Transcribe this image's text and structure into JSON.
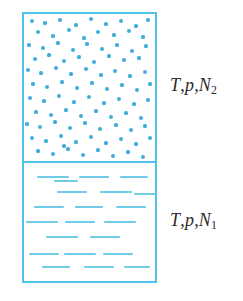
{
  "figure": {
    "background_color": "#ffffff",
    "outline_color": "#4FC3E8",
    "molecule_color": "#3FAEDC",
    "dash_color": "#6FCBE8",
    "label_color": "#2b2b2b"
  },
  "labels": {
    "gas": {
      "temperature_symbol": "T",
      "separator": ",",
      "pressure_symbol": "p",
      "amount_symbol": "N",
      "amount_subscript": "2",
      "full_text": "T, p, N2"
    },
    "liquid": {
      "temperature_symbol": "T",
      "separator": ",",
      "pressure_symbol": "p",
      "amount_symbol": "N",
      "amount_subscript": "1",
      "full_text": "T, p, N1"
    }
  },
  "regions": {
    "gas": {
      "name": "gas-phase",
      "representation": "scattered-dots",
      "molecule_count": 96
    },
    "liquid": {
      "name": "liquid-phase",
      "representation": "horizontal-dashes",
      "molecule_count": 21
    }
  },
  "chart_data": {
    "type": "scatter",
    "xlabel": "",
    "ylabel": "",
    "xlim": [
      0,
      131
    ],
    "ylim": [
      0,
      267
    ],
    "grid": false,
    "legend": "none",
    "annotations": [
      "T, p, N2",
      "T, p, N1"
    ],
    "series": [
      {
        "name": "gas-molecules",
        "marker": "dot",
        "color": "#3FAEDC",
        "points": [
          [
            8,
            7,
            2.0
          ],
          [
            21,
            9,
            1.6
          ],
          [
            36,
            6,
            2.0
          ],
          [
            52,
            11,
            1.6
          ],
          [
            67,
            5,
            2.4
          ],
          [
            82,
            10,
            1.6
          ],
          [
            97,
            7,
            2.0
          ],
          [
            112,
            12,
            1.6
          ],
          [
            124,
            6,
            2.0
          ],
          [
            14,
            18,
            2.4
          ],
          [
            29,
            22,
            1.6
          ],
          [
            45,
            16,
            2.0
          ],
          [
            60,
            24,
            1.6
          ],
          [
            74,
            18,
            2.4
          ],
          [
            90,
            21,
            1.6
          ],
          [
            105,
            17,
            2.0
          ],
          [
            119,
            23,
            1.6
          ],
          [
            5,
            31,
            1.6
          ],
          [
            19,
            34,
            2.4
          ],
          [
            34,
            29,
            1.6
          ],
          [
            49,
            36,
            2.0
          ],
          [
            63,
            30,
            1.6
          ],
          [
            78,
            35,
            2.4
          ],
          [
            93,
            31,
            1.6
          ],
          [
            108,
            37,
            2.0
          ],
          [
            122,
            32,
            1.6
          ],
          [
            11,
            45,
            2.0
          ],
          [
            25,
            41,
            1.6
          ],
          [
            40,
            47,
            2.4
          ],
          [
            55,
            43,
            1.6
          ],
          [
            70,
            48,
            2.0
          ],
          [
            85,
            42,
            1.6
          ],
          [
            100,
            46,
            2.4
          ],
          [
            115,
            44,
            1.6
          ],
          [
            4,
            56,
            2.4
          ],
          [
            17,
            59,
            1.6
          ],
          [
            32,
            54,
            2.0
          ],
          [
            47,
            60,
            1.6
          ],
          [
            62,
            55,
            2.4
          ],
          [
            77,
            61,
            1.6
          ],
          [
            91,
            57,
            2.0
          ],
          [
            106,
            62,
            1.6
          ],
          [
            121,
            58,
            2.0
          ],
          [
            9,
            70,
            1.6
          ],
          [
            23,
            73,
            2.4
          ],
          [
            38,
            68,
            1.6
          ],
          [
            53,
            74,
            2.0
          ],
          [
            68,
            69,
            1.6
          ],
          [
            83,
            75,
            2.4
          ],
          [
            98,
            71,
            1.6
          ],
          [
            113,
            76,
            2.0
          ],
          [
            126,
            70,
            1.6
          ],
          [
            6,
            84,
            2.0
          ],
          [
            20,
            87,
            1.6
          ],
          [
            35,
            82,
            2.4
          ],
          [
            50,
            88,
            1.6
          ],
          [
            65,
            83,
            2.0
          ],
          [
            80,
            89,
            1.6
          ],
          [
            95,
            85,
            2.4
          ],
          [
            110,
            90,
            1.6
          ],
          [
            124,
            86,
            2.0
          ],
          [
            12,
            98,
            1.6
          ],
          [
            27,
            101,
            2.4
          ],
          [
            42,
            96,
            1.6
          ],
          [
            57,
            102,
            2.0
          ],
          [
            72,
            97,
            1.6
          ],
          [
            87,
            103,
            2.4
          ],
          [
            102,
            99,
            1.6
          ],
          [
            117,
            104,
            2.0
          ],
          [
            3,
            110,
            1.6
          ],
          [
            16,
            113,
            2.0
          ],
          [
            31,
            108,
            1.6
          ],
          [
            46,
            114,
            2.4
          ],
          [
            61,
            109,
            1.6
          ],
          [
            76,
            115,
            2.0
          ],
          [
            92,
            111,
            1.6
          ],
          [
            107,
            116,
            2.4
          ],
          [
            121,
            112,
            1.6
          ],
          [
            8,
            124,
            2.4
          ],
          [
            22,
            127,
            1.6
          ],
          [
            37,
            122,
            2.0
          ],
          [
            52,
            128,
            1.6
          ],
          [
            67,
            123,
            2.4
          ],
          [
            82,
            129,
            1.6
          ],
          [
            97,
            125,
            2.0
          ],
          [
            112,
            130,
            1.6
          ],
          [
            126,
            124,
            2.0
          ],
          [
            14,
            137,
            1.6
          ],
          [
            29,
            140,
            2.0
          ],
          [
            44,
            135,
            1.6
          ],
          [
            59,
            141,
            2.4
          ],
          [
            74,
            136,
            1.6
          ],
          [
            89,
            142,
            2.0
          ],
          [
            104,
            138,
            1.6
          ],
          [
            119,
            143,
            2.4
          ],
          [
            40,
            132,
            1.6
          ]
        ]
      },
      {
        "name": "liquid-molecules",
        "marker": "dash",
        "color": "#6FCBE8",
        "dashes": [
          [
            13,
            13,
            32
          ],
          [
            55,
            13,
            30
          ],
          [
            96,
            13,
            28
          ],
          [
            33,
            28,
            30
          ],
          [
            76,
            28,
            32
          ],
          [
            10,
            43,
            30
          ],
          [
            51,
            43,
            28
          ],
          [
            92,
            43,
            30
          ],
          [
            2,
            58,
            32
          ],
          [
            41,
            58,
            30
          ],
          [
            80,
            58,
            32
          ],
          [
            22,
            73,
            32
          ],
          [
            66,
            73,
            30
          ],
          [
            5,
            90,
            30
          ],
          [
            40,
            90,
            32
          ],
          [
            79,
            90,
            30
          ],
          [
            18,
            103,
            28
          ],
          [
            60,
            103,
            30
          ],
          [
            100,
            103,
            26
          ],
          [
            30,
            17,
            24
          ],
          [
            110,
            30,
            22
          ]
        ]
      }
    ]
  }
}
